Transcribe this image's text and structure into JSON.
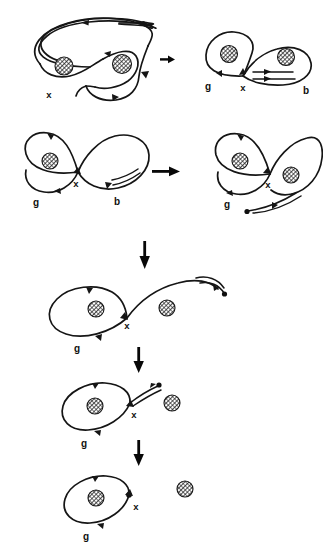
{
  "figure": {
    "background_color": "#ffffff",
    "ink_color": "#151515",
    "hatch_color": "#2a2a2a"
  },
  "labels": {
    "x": "x",
    "g": "g",
    "b": "b"
  },
  "panels": [
    {
      "id": "panel-1",
      "name": "initial-spiral-curve",
      "row": 1,
      "column": "left",
      "punctures": 2,
      "labels": [
        "x"
      ],
      "arrowheads": 4
    },
    {
      "id": "panel-2",
      "name": "figure-eight-with-band",
      "row": 1,
      "column": "right",
      "punctures": 2,
      "labels": [
        "g",
        "x",
        "b"
      ],
      "arrowheads": 3
    },
    {
      "id": "panel-3",
      "name": "figure-eight-left",
      "row": 2,
      "column": "left",
      "punctures": 1,
      "labels": [
        "g",
        "x",
        "b"
      ],
      "arrowheads": 4
    },
    {
      "id": "panel-4",
      "name": "figure-eight-with-detached-strand",
      "row": 2,
      "column": "right",
      "punctures": 2,
      "labels": [
        "g",
        "x"
      ],
      "arrowheads": 4
    },
    {
      "id": "panel-5",
      "name": "loop-with-trailing-strand",
      "row": 3,
      "column": "center",
      "punctures": 2,
      "labels": [
        "g",
        "x"
      ],
      "arrowheads": 4
    },
    {
      "id": "panel-6",
      "name": "loop-with-short-strand",
      "row": 4,
      "column": "center",
      "punctures": 2,
      "labels": [
        "g",
        "x"
      ],
      "arrowheads": 4
    },
    {
      "id": "panel-7",
      "name": "final-simple-loop",
      "row": 5,
      "column": "center",
      "punctures": 2,
      "labels": [
        "g",
        "x"
      ],
      "arrowheads": 3
    }
  ],
  "transition_arrows": [
    {
      "id": "arrow-1",
      "name": "arrow-right-small",
      "direction": "right",
      "between": [
        "panel-1",
        "panel-2"
      ]
    },
    {
      "id": "arrow-2",
      "name": "arrow-right",
      "direction": "right",
      "between": [
        "panel-3",
        "panel-4"
      ]
    },
    {
      "id": "arrow-3",
      "name": "arrow-down",
      "direction": "down",
      "between": [
        "panel-4",
        "panel-5"
      ]
    },
    {
      "id": "arrow-4",
      "name": "arrow-down",
      "direction": "down",
      "between": [
        "panel-5",
        "panel-6"
      ]
    },
    {
      "id": "arrow-5",
      "name": "arrow-down",
      "direction": "down",
      "between": [
        "panel-6",
        "panel-7"
      ]
    }
  ]
}
